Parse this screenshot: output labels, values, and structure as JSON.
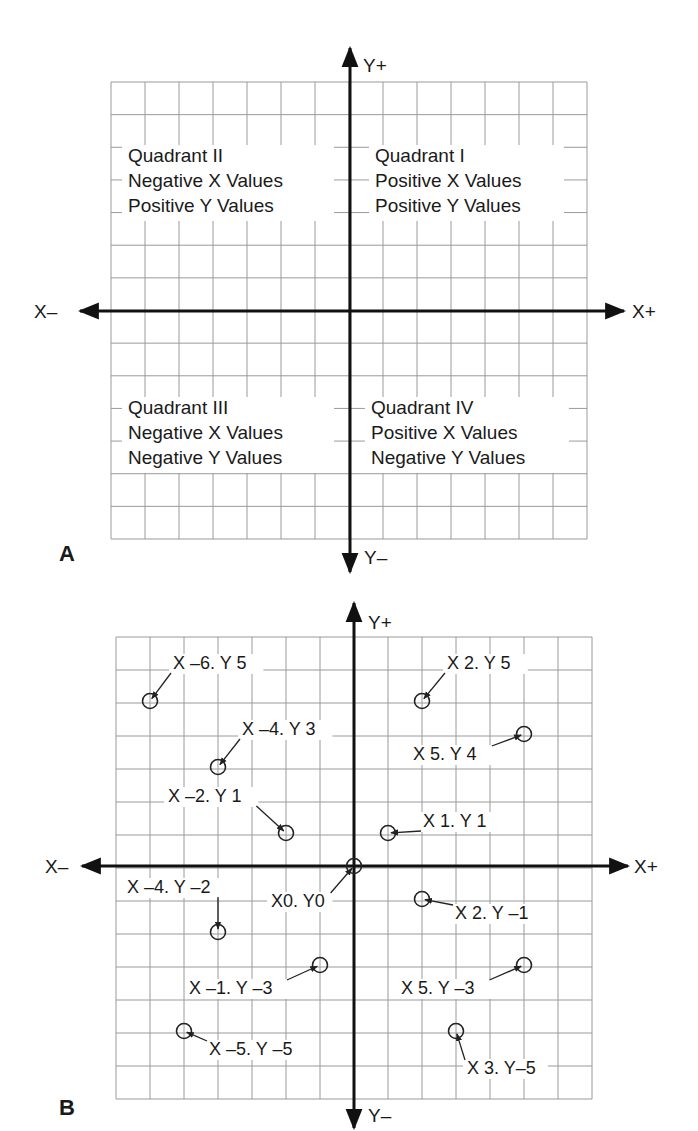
{
  "chart_data": [
    {
      "type": "scatter",
      "panel": "A",
      "title": "",
      "xlabel": "",
      "ylabel": "",
      "axis_labels": {
        "x_neg": "X–",
        "x_pos": "X+",
        "y_pos": "Y+",
        "y_neg": "Y–"
      },
      "grid": true,
      "grid_cells": [
        14,
        14
      ],
      "xlim": [
        -7,
        7
      ],
      "ylim": [
        -7,
        7
      ],
      "annotations": [
        {
          "quadrant": "II",
          "lines": [
            "Quadrant II",
            "Negative X Values",
            "Positive Y Values"
          ]
        },
        {
          "quadrant": "I",
          "lines": [
            "Quadrant I",
            "Positive X Values",
            "Positive Y Values"
          ]
        },
        {
          "quadrant": "III",
          "lines": [
            "Quadrant III",
            "Negative X Values",
            "Negative Y Values"
          ]
        },
        {
          "quadrant": "IV",
          "lines": [
            "Quadrant IV",
            "Positive X Values",
            "Negative Y Values"
          ]
        }
      ]
    },
    {
      "type": "scatter",
      "panel": "B",
      "title": "",
      "xlabel": "",
      "ylabel": "",
      "axis_labels": {
        "x_neg": "X–",
        "x_pos": "X+",
        "y_pos": "Y+",
        "y_neg": "Y–"
      },
      "grid": true,
      "grid_cells": [
        14,
        14
      ],
      "xlim": [
        -7,
        7
      ],
      "ylim": [
        -7,
        7
      ],
      "series": [
        {
          "name": "points",
          "points": [
            {
              "x": -6,
              "y": 5,
              "label": "X –6. Y 5"
            },
            {
              "x": 2,
              "y": 5,
              "label": "X 2. Y 5"
            },
            {
              "x": -4,
              "y": 3,
              "label": "X –4. Y 3"
            },
            {
              "x": 5,
              "y": 4,
              "label": "X 5. Y 4"
            },
            {
              "x": -2,
              "y": 1,
              "label": "X –2. Y 1"
            },
            {
              "x": 1,
              "y": 1,
              "label": "X 1. Y 1"
            },
            {
              "x": 0,
              "y": 0,
              "label": "X0. Y0"
            },
            {
              "x": -4,
              "y": -2,
              "label": "X –4. Y –2"
            },
            {
              "x": 2,
              "y": -1,
              "label": "X 2. Y –1"
            },
            {
              "x": -1,
              "y": -3,
              "label": "X –1. Y –3"
            },
            {
              "x": 5,
              "y": -3,
              "label": "X 5. Y –3"
            },
            {
              "x": -5,
              "y": -5,
              "label": "X –5. Y –5"
            },
            {
              "x": 3,
              "y": -5,
              "label": "X 3. Y–5"
            }
          ]
        }
      ]
    }
  ],
  "panels": {
    "A": {
      "letter": "A",
      "x_neg": "X–",
      "x_pos": "X+",
      "y_pos": "Y+",
      "y_neg": "Y–",
      "quadrants": {
        "II": [
          "Quadrant II",
          "Negative X Values",
          "Positive Y Values"
        ],
        "I": [
          "Quadrant I",
          "Positive X Values",
          "Positive Y Values"
        ],
        "III": [
          "Quadrant III",
          "Negative X Values",
          "Negative Y Values"
        ],
        "IV": [
          "Quadrant IV",
          "Positive X Values",
          "Negative Y Values"
        ]
      }
    },
    "B": {
      "letter": "B",
      "x_neg": "X–",
      "x_pos": "X+",
      "y_pos": "Y+",
      "y_neg": "Y–",
      "points": [
        {
          "x": -6,
          "y": 5,
          "label": "X –6. Y 5",
          "lx": 173,
          "ly": 669,
          "anchor": "start"
        },
        {
          "x": 2,
          "y": 5,
          "label": "X 2. Y 5",
          "lx": 447,
          "ly": 669,
          "anchor": "start"
        },
        {
          "x": -4,
          "y": 3,
          "label": "X –4. Y 3",
          "lx": 242,
          "ly": 735,
          "anchor": "start"
        },
        {
          "x": 5,
          "y": 4,
          "label": "X 5. Y 4",
          "lx": 413,
          "ly": 760,
          "anchor": "start"
        },
        {
          "x": -2,
          "y": 1,
          "label": "X –2. Y 1",
          "lx": 168,
          "ly": 802,
          "anchor": "start"
        },
        {
          "x": 1,
          "y": 1,
          "label": "X 1. Y 1",
          "lx": 423,
          "ly": 827,
          "anchor": "start"
        },
        {
          "x": 0,
          "y": 0,
          "label": "X0. Y0",
          "lx": 271,
          "ly": 907,
          "anchor": "start"
        },
        {
          "x": -4,
          "y": -2,
          "label": "X –4. Y –2",
          "lx": 127,
          "ly": 893,
          "anchor": "start"
        },
        {
          "x": 2,
          "y": -1,
          "label": "X 2. Y –1",
          "lx": 455,
          "ly": 919,
          "anchor": "start"
        },
        {
          "x": -1,
          "y": -3,
          "label": "X –1. Y –3",
          "lx": 189,
          "ly": 994,
          "anchor": "start"
        },
        {
          "x": 5,
          "y": -3,
          "label": "X 5. Y –3",
          "lx": 401,
          "ly": 994,
          "anchor": "start"
        },
        {
          "x": -5,
          "y": -5,
          "label": "X –5. Y –5",
          "lx": 209,
          "ly": 1055,
          "anchor": "start"
        },
        {
          "x": 3,
          "y": -5,
          "label": "X 3. Y–5",
          "lx": 467,
          "ly": 1074,
          "anchor": "start"
        }
      ]
    }
  }
}
